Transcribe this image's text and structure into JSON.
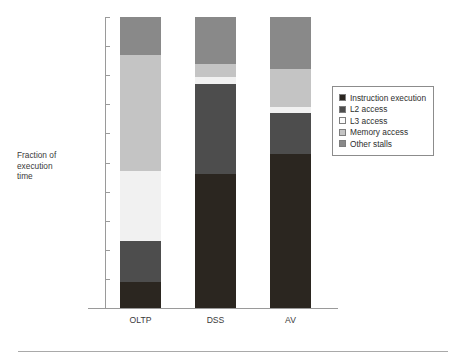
{
  "chart_data": {
    "type": "bar",
    "subtype": "stacked-bar-100-percent",
    "title": "",
    "xlabel": "",
    "ylabel": "Fraction of\nexecution\ntime",
    "ylim": [
      0,
      100
    ],
    "ytick_labels": [
      "100%",
      "90%",
      "80%",
      "70%",
      "60%",
      "50%",
      "40%",
      "30%",
      "20%",
      "10%",
      "0%"
    ],
    "ytick_values": [
      100,
      90,
      80,
      70,
      60,
      50,
      40,
      30,
      20,
      10,
      0
    ],
    "grid": false,
    "legend_position": "right",
    "categories": [
      "OLTP",
      "DSS",
      "AV"
    ],
    "series": [
      {
        "name": "Instruction execution",
        "color": "#2b2620",
        "values": [
          9,
          46,
          53
        ]
      },
      {
        "name": "L2 access",
        "color": "#4d4d4d",
        "values": [
          14,
          31,
          14
        ]
      },
      {
        "name": "L3 access",
        "color": "#f1f1f1",
        "values": [
          24,
          2.5,
          2
        ]
      },
      {
        "name": "Memory access",
        "color": "#c4c4c4",
        "values": [
          40,
          4.5,
          13
        ]
      },
      {
        "name": "Other stalls",
        "color": "#898989",
        "values": [
          13,
          16,
          18
        ]
      }
    ],
    "stack_tops": {
      "OLTP": [
        9,
        23,
        47,
        87,
        100
      ],
      "DSS": [
        46,
        77,
        79.5,
        84,
        100
      ],
      "AV": [
        53,
        67,
        69,
        82,
        100
      ]
    }
  },
  "legend": {
    "items": [
      {
        "label": "Instruction execution",
        "color": "#2b2620"
      },
      {
        "label": "L2 access",
        "color": "#4d4d4d"
      },
      {
        "label": "L3 access",
        "color": "#fbfbfb"
      },
      {
        "label": "Memory access",
        "color": "#c4c4c4"
      },
      {
        "label": "Other stalls",
        "color": "#898989"
      }
    ]
  },
  "colors": {
    "axis": "#9a9a9a",
    "text": "#3a3a3a",
    "background": "#ffffff",
    "rule": "#a9a9a9"
  }
}
